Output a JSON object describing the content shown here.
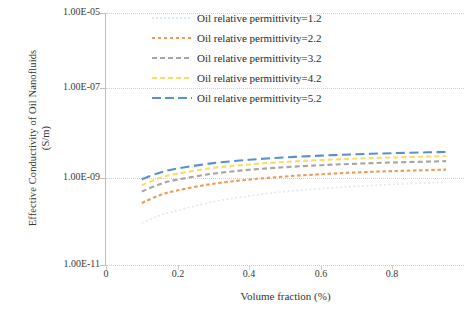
{
  "chart_data": {
    "type": "line",
    "title": "",
    "xlabel": "Volume fraction (%)",
    "ylabel": "Effective Conductivity of  Oil Nanofluids (S/m)",
    "ylabel_line1": "Effective Conductivity of  Oil Nanofluids",
    "ylabel_line2": "(S/m)",
    "xlim": [
      0,
      1.0
    ],
    "ylim": [
      1e-11,
      1e-05
    ],
    "yscale": "log",
    "grid": true,
    "legend_position": "top-right-inside",
    "xticks": [
      "0",
      "0.2",
      "0.4",
      "0.6",
      "0.8"
    ],
    "xtick_values": [
      0,
      0.2,
      0.4,
      0.6,
      0.8
    ],
    "yticks": [
      "1.00E-05",
      "1.00E-07",
      "1.00E-09",
      "1.00E-11"
    ],
    "ytick_values": [
      1e-05,
      1e-07,
      1e-09,
      1e-11
    ],
    "x": [
      0.1,
      0.15,
      0.2,
      0.3,
      0.4,
      0.5,
      0.6,
      0.7,
      0.8,
      0.9,
      0.95
    ],
    "series": [
      {
        "name": "Oil relative permittivity=1.2",
        "color": "#dce9f7",
        "dash": "dotted",
        "values": [
          1e-10,
          1.5e-10,
          2e-10,
          3.2e-10,
          4.4e-10,
          5.6e-10,
          6.6e-10,
          7.5e-10,
          8.3e-10,
          9e-10,
          9.4e-10
        ]
      },
      {
        "name": "Oil relative permittivity=2.2",
        "color": "#ed9b55",
        "dash": "dashed-short",
        "values": [
          3e-10,
          4.6e-10,
          6e-10,
          8.6e-10,
          1.08e-09,
          1.28e-09,
          1.45e-09,
          1.6e-09,
          1.72e-09,
          1.82e-09,
          1.87e-09
        ]
      },
      {
        "name": "Oil relative permittivity=3.2",
        "color": "#a5a5a5",
        "dash": "dashed-medium",
        "values": [
          5.6e-10,
          8.4e-10,
          1.08e-09,
          1.5e-09,
          1.85e-09,
          2.13e-09,
          2.38e-09,
          2.58e-09,
          2.76e-09,
          2.9e-09,
          2.97e-09
        ]
      },
      {
        "name": "Oil relative permittivity=4.2",
        "color": "#ffd966",
        "dash": "dashed-medium",
        "values": [
          8e-10,
          1.18e-09,
          1.5e-09,
          2.05e-09,
          2.48e-09,
          2.85e-09,
          3.15e-09,
          3.42e-09,
          3.64e-09,
          3.82e-09,
          3.9e-09
        ]
      },
      {
        "name": "Oil relative permittivity=5.2",
        "color": "#5b8fd4",
        "dash": "dashed-long",
        "values": [
          1.1e-09,
          1.58e-09,
          1.98e-09,
          2.66e-09,
          3.2e-09,
          3.64e-09,
          4.02e-09,
          4.34e-09,
          4.6e-09,
          4.82e-09,
          4.92e-09
        ]
      }
    ]
  },
  "legend": {
    "items": [
      {
        "label": "Oil relative permittivity=1.2"
      },
      {
        "label": "Oil relative permittivity=2.2"
      },
      {
        "label": "Oil relative permittivity=3.2"
      },
      {
        "label": "Oil relative permittivity=4.2"
      },
      {
        "label": "Oil relative permittivity=5.2"
      }
    ]
  }
}
